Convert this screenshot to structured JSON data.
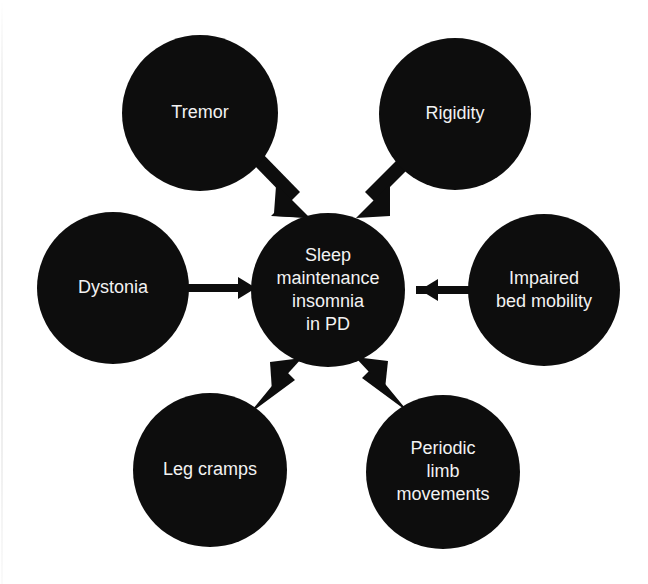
{
  "figure": {
    "type": "concept-map",
    "background_color": "#ffffff",
    "node_fill_color": "#0d0d0d",
    "node_text_color": "#f2f2f2",
    "arrow_color": "#0d0d0d"
  },
  "center_node": {
    "id": "sleep-maintenance-insomnia",
    "lines": [
      "Sleep",
      "maintenance",
      "insomnia",
      "in PD"
    ],
    "cx": 328,
    "cy": 290,
    "r": 77
  },
  "nodes": [
    {
      "id": "tremor",
      "lines": [
        "Tremor"
      ],
      "cx": 200,
      "cy": 113,
      "r": 78,
      "arrow": "diagonal-down-right"
    },
    {
      "id": "rigidity",
      "lines": [
        "Rigidity"
      ],
      "cx": 455,
      "cy": 114,
      "r": 76,
      "arrow": "diagonal-down-left"
    },
    {
      "id": "dystonia",
      "lines": [
        "Dystonia"
      ],
      "cx": 113,
      "cy": 288,
      "r": 76,
      "arrow": "horizontal-right"
    },
    {
      "id": "impaired-bed-mobility",
      "lines": [
        "Impaired",
        "bed mobility"
      ],
      "cx": 544,
      "cy": 290,
      "r": 76,
      "arrow": "horizontal-left"
    },
    {
      "id": "leg-cramps",
      "lines": [
        "Leg cramps"
      ],
      "cx": 210,
      "cy": 470,
      "r": 77,
      "arrow": "diagonal-up-right"
    },
    {
      "id": "periodic-limb-movements",
      "lines": [
        "Periodic",
        "limb",
        "movements"
      ],
      "cx": 443,
      "cy": 472,
      "r": 77,
      "arrow": "diagonal-up-left"
    }
  ],
  "edges": [
    {
      "id": "tremor-to-center",
      "from": "tremor",
      "to": "sleep-maintenance-insomnia"
    },
    {
      "id": "rigidity-to-center",
      "from": "rigidity",
      "to": "sleep-maintenance-insomnia"
    },
    {
      "id": "dystonia-to-center",
      "from": "dystonia",
      "to": "sleep-maintenance-insomnia"
    },
    {
      "id": "impaired-bed-mobility-to-center",
      "from": "impaired-bed-mobility",
      "to": "sleep-maintenance-insomnia"
    },
    {
      "id": "leg-cramps-to-center",
      "from": "leg-cramps",
      "to": "sleep-maintenance-insomnia"
    },
    {
      "id": "periodic-limb-movements-to-center",
      "from": "periodic-limb-movements",
      "to": "sleep-maintenance-insomnia"
    }
  ]
}
